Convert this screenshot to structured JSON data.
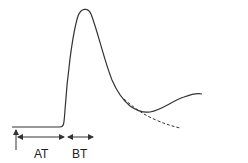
{
  "diagram": {
    "type": "indicator-dilution curve",
    "labels": {
      "at": "AT",
      "bt": "BT"
    },
    "colors": {
      "stroke": "#333333",
      "background": "#ffffff"
    },
    "curve": {
      "baseline": "flat from x~15 to x~63 at y~127",
      "peak": "sharp rise to peak near (84,10)",
      "recirculation": "minimum near (148,112) rising to (200,95)",
      "extrapolation": "dashed decay from (124,99) to (180,128)"
    }
  }
}
